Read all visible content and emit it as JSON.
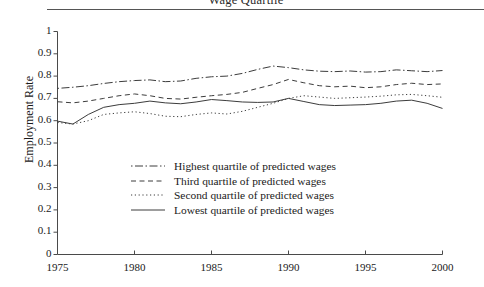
{
  "figure": {
    "title": "Wage Quartile",
    "ylabel": "Employment Rate",
    "xlabel": ""
  },
  "legend": {
    "items": [
      {
        "label": "Highest quartile of predicted wages",
        "style": "dash-dot"
      },
      {
        "label": "Third quartile of predicted wages",
        "style": "dashed"
      },
      {
        "label": "Second quartile of predicted wages",
        "style": "dotted"
      },
      {
        "label": "Lowest quartile of predicted wages",
        "style": "solid"
      }
    ]
  },
  "chart_data": {
    "type": "line",
    "title": "Wage Quartile",
    "xlabel": "",
    "ylabel": "Employment Rate",
    "xlim": [
      1975,
      2000
    ],
    "ylim": [
      0,
      1
    ],
    "grid": false,
    "legend_position": "center-left",
    "xticks": [
      1975,
      1980,
      1985,
      1990,
      1995,
      2000
    ],
    "yticks": [
      0,
      0.1,
      0.2,
      0.3,
      0.4,
      0.5,
      0.6,
      0.7,
      0.8,
      0.9,
      1
    ],
    "x": [
      1975,
      1976,
      1977,
      1978,
      1979,
      1980,
      1981,
      1982,
      1983,
      1984,
      1985,
      1986,
      1987,
      1988,
      1989,
      1990,
      1991,
      1992,
      1993,
      1994,
      1995,
      1996,
      1997,
      1998,
      1999,
      2000
    ],
    "series": [
      {
        "name": "Highest quartile of predicted wages",
        "style": "dash-dot",
        "color": "#3c3c3c",
        "values": [
          0.745,
          0.75,
          0.757,
          0.767,
          0.775,
          0.78,
          0.783,
          0.775,
          0.778,
          0.79,
          0.797,
          0.8,
          0.812,
          0.83,
          0.845,
          0.838,
          0.828,
          0.822,
          0.82,
          0.823,
          0.818,
          0.82,
          0.828,
          0.824,
          0.82,
          0.825
        ]
      },
      {
        "name": "Third quartile of predicted wages",
        "style": "dashed",
        "color": "#3c3c3c",
        "values": [
          0.685,
          0.68,
          0.688,
          0.7,
          0.712,
          0.72,
          0.712,
          0.7,
          0.697,
          0.705,
          0.712,
          0.718,
          0.727,
          0.745,
          0.762,
          0.785,
          0.77,
          0.757,
          0.752,
          0.755,
          0.748,
          0.752,
          0.762,
          0.768,
          0.762,
          0.765
        ]
      },
      {
        "name": "Second quartile of predicted wages",
        "style": "dotted",
        "color": "#3c3c3c",
        "values": [
          0.592,
          0.585,
          0.6,
          0.628,
          0.635,
          0.64,
          0.632,
          0.62,
          0.618,
          0.628,
          0.635,
          0.63,
          0.642,
          0.66,
          0.678,
          0.7,
          0.712,
          0.706,
          0.7,
          0.703,
          0.706,
          0.71,
          0.716,
          0.718,
          0.712,
          0.705
        ]
      },
      {
        "name": "Lowest quartile of predicted wages",
        "style": "solid",
        "color": "#3c3c3c",
        "values": [
          0.598,
          0.585,
          0.628,
          0.66,
          0.672,
          0.678,
          0.688,
          0.68,
          0.676,
          0.684,
          0.695,
          0.69,
          0.684,
          0.682,
          0.684,
          0.7,
          0.686,
          0.672,
          0.668,
          0.67,
          0.672,
          0.678,
          0.688,
          0.692,
          0.678,
          0.655
        ]
      }
    ]
  }
}
